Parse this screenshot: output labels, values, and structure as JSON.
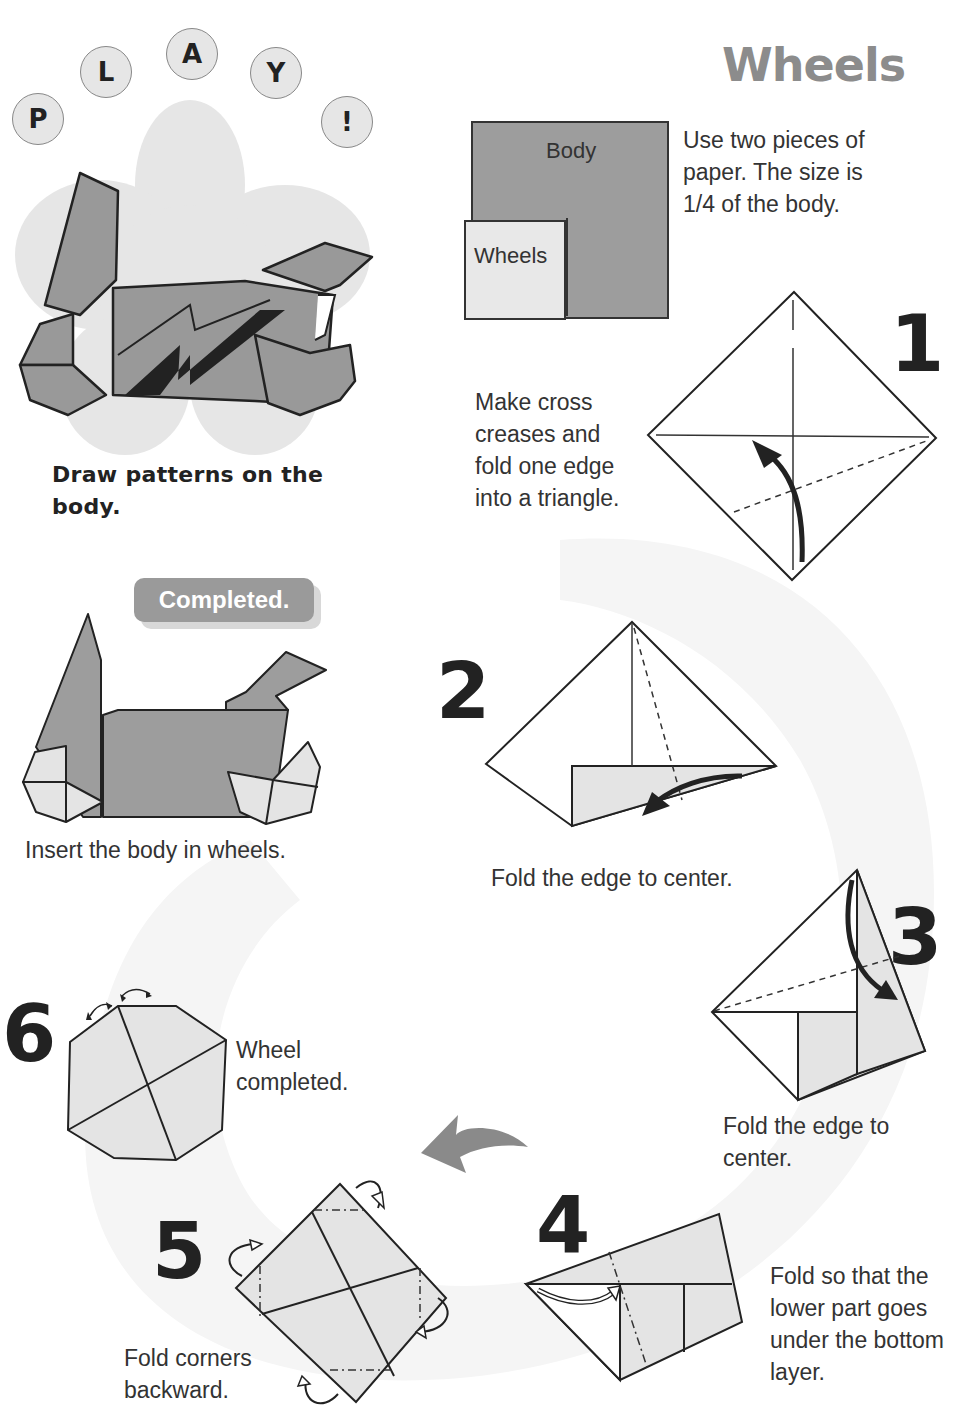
{
  "page": {
    "title": "Wheels",
    "play_letters": [
      "P",
      "L",
      "A",
      "Y",
      "!"
    ],
    "colors": {
      "body_paper": "#9a9a9a",
      "wheel_paper": "#e4e4e4",
      "title_gray": "#8c8c8c",
      "ink": "#222222",
      "background_swirl": "#f4f4f4"
    }
  },
  "intro": {
    "paper_labels": {
      "body": "Body",
      "wheels": "Wheels"
    },
    "description": "Use two pieces of paper. The size is 1/4 of the body.",
    "lines": [
      "Use two pieces of",
      "paper. The size is",
      "1/4 of the body."
    ]
  },
  "play_section": {
    "caption_lines": [
      "Draw patterns on the",
      "body."
    ]
  },
  "completed": {
    "badge": "Completed.",
    "caption": "Insert the body in wheels."
  },
  "steps": [
    {
      "number": "1",
      "lines": [
        "Make cross",
        "creases and",
        "fold one edge",
        "into a triangle."
      ]
    },
    {
      "number": "2",
      "lines": [
        "Fold the edge to center."
      ]
    },
    {
      "number": "3",
      "lines": [
        "Fold the edge to",
        "center."
      ]
    },
    {
      "number": "4",
      "lines": [
        "Fold so that the",
        "lower part goes",
        "under the bottom",
        "layer."
      ]
    },
    {
      "number": "5",
      "lines": [
        "Fold corners",
        "backward."
      ]
    },
    {
      "number": "6",
      "lines": [
        "Wheel",
        "completed."
      ]
    }
  ]
}
